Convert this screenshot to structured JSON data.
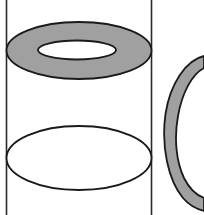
{
  "canvas": {
    "width": 204,
    "height": 215,
    "background": "#ffffff"
  },
  "palette": {
    "shaded_fill": "#a0a0a0",
    "unshaded_fill": "#ffffff",
    "stroke": "#1a1a1a",
    "stroke_light": "#3a3a3a"
  },
  "chart_data": {
    "type": "diagram",
    "elements": [
      {
        "name": "cylinder-left-edge",
        "kind": "line",
        "x1": 6.5,
        "y1": 0,
        "x2": 6.5,
        "y2": 215,
        "stroke": "#2a2a2a",
        "stroke_width": 1.6
      },
      {
        "name": "cylinder-right-edge",
        "kind": "line",
        "x1": 151.5,
        "y1": 0,
        "x2": 151.5,
        "y2": 215,
        "stroke": "#2a2a2a",
        "stroke_width": 1.6
      },
      {
        "name": "top-washer-outer",
        "kind": "ellipse",
        "cx": 79,
        "cy": 50.5,
        "rx": 72.5,
        "ry": 28.5,
        "fill": "#a0a0a0",
        "stroke": "#1a1a1a",
        "stroke_width": 1.8
      },
      {
        "name": "top-washer-inner-hole",
        "kind": "ellipse",
        "cx": 77,
        "cy": 50,
        "rx": 39,
        "ry": 9.5,
        "fill": "#ffffff",
        "stroke": "#1a1a1a",
        "stroke_width": 1.8
      },
      {
        "name": "bottom-ellipse",
        "kind": "ellipse",
        "cx": 79,
        "cy": 158,
        "rx": 72.5,
        "ry": 32,
        "fill": "#ffffff",
        "stroke": "#1a1a1a",
        "stroke_width": 1.8
      },
      {
        "name": "right-partial-ring",
        "kind": "annulus-arc",
        "cx": 216,
        "cy": 128,
        "rx_outer": 53,
        "ry_outer": 73,
        "band_width": 13,
        "fill": "#a0a0a0",
        "stroke": "#1a1a1a",
        "stroke_width": 1.8
      }
    ],
    "axis_ranges": {
      "x": [
        0,
        204
      ],
      "y": [
        0,
        215
      ]
    },
    "grid": false,
    "legend": null
  }
}
